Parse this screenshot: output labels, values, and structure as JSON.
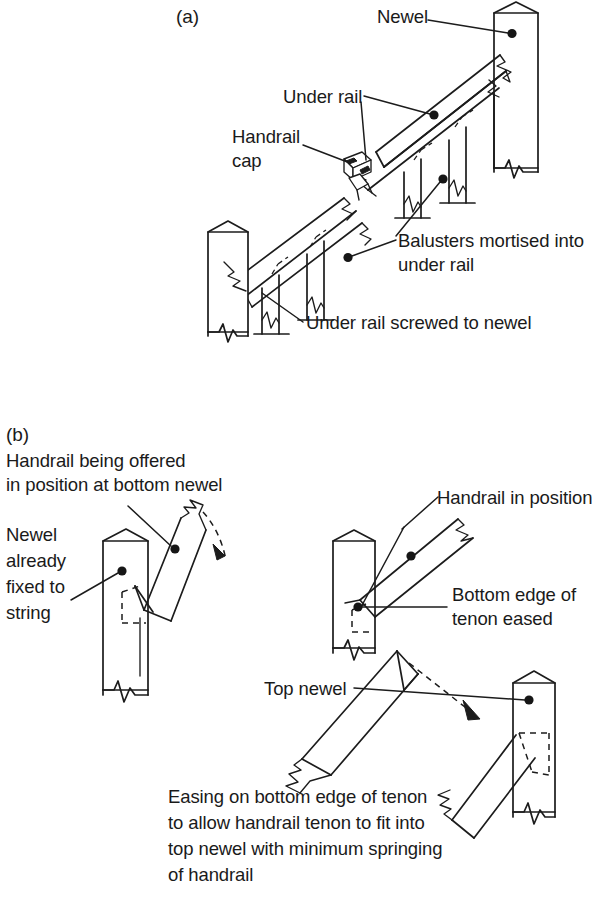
{
  "figure": {
    "background_color": "#ffffff",
    "ink_color": "#1c1c1c",
    "sections": [
      {
        "id": "a",
        "label": "(a)"
      },
      {
        "id": "b",
        "label": "(b)"
      }
    ]
  },
  "section_a": {
    "label": "(a)",
    "annotations": {
      "newel": "Newel",
      "under_rail": "Under rail",
      "handrail_cap_line1": "Handrail",
      "handrail_cap_line2": "cap",
      "balusters_line1": "Balusters mortised into",
      "balusters_line2": "under rail",
      "under_rail_screwed": "Under rail screwed to newel"
    }
  },
  "section_b": {
    "label": "(b)",
    "annotations": {
      "handrail_offered_line1": "Handrail being offered",
      "handrail_offered_line2": "in position at bottom newel",
      "newel_fixed_line1": "Newel",
      "newel_fixed_line2": "already",
      "newel_fixed_line3": "fixed to",
      "newel_fixed_line4": "string",
      "handrail_in_position": "Handrail in position",
      "bottom_edge_line1": "Bottom edge of",
      "bottom_edge_line2": "tenon eased",
      "top_newel": "Top newel"
    },
    "caption": {
      "line1": "Easing on bottom edge of tenon",
      "line2": "to allow handrail tenon to fit into",
      "line3": "top newel with minimum springing",
      "line4": "of handrail"
    }
  }
}
